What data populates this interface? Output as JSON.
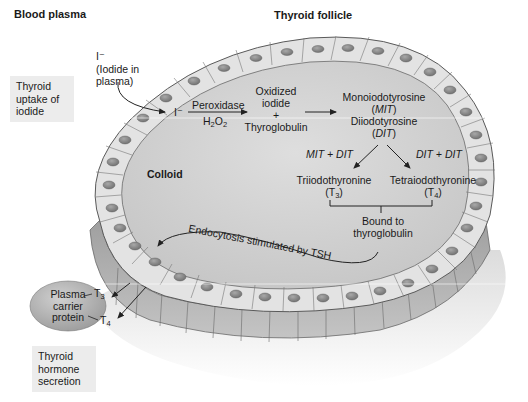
{
  "title": {
    "blood_plasma": "Blood plasma",
    "thyroid_follicle": "Thyroid follicle"
  },
  "iodide": {
    "ion": "I⁻",
    "desc_line1": "(Iodide in",
    "desc_line2": "plasma)",
    "ion_in_cell": "I⁻"
  },
  "side_boxes": {
    "uptake": [
      "Thyroid",
      "uptake of",
      "iodide"
    ],
    "secretion": [
      "Thyroid",
      "hormone",
      "secretion"
    ]
  },
  "steps": {
    "enzyme": "Peroxidase",
    "cofactor_main": "H",
    "cofactor_sub1": "2",
    "cofactor_mid": "O",
    "cofactor_sub2": "2",
    "oxidized": [
      "Oxidized",
      "iodide",
      "+",
      "Thyroglobulin"
    ],
    "mit_name": "Monoiodotyrosine",
    "mit_abbr": "MIT",
    "dit_name": "Diiodotyrosine",
    "dit_abbr": "DIT",
    "mit_dit": "MIT + DIT",
    "dit_dit": "DIT + DIT",
    "t3_name": "Triiodothyronine",
    "t3_sym": "T",
    "t3_sub": "3",
    "t4_name": "Tetraiodothyronine",
    "t4_sym": "T",
    "t4_sub": "4",
    "bound": [
      "Bound to",
      "thyroglobulin"
    ]
  },
  "colloid_label": "Colloid",
  "endocytosis_label": "Endocytosis stimulated by TSH",
  "carrier": {
    "lines": [
      "Plasma",
      "carrier",
      "protein"
    ],
    "t3_sym": "T",
    "t3_sub": "3",
    "t4_sym": "T",
    "t4_sub": "4"
  },
  "colors": {
    "colloid": "#d3d3d3",
    "cell_top": "#e4e4e4",
    "cell_side": "#a9a9a9",
    "nucleus": "#8d8d8d",
    "outline": "#555555",
    "box_bg": "#ececec",
    "carrier": "#b5b5b5"
  }
}
